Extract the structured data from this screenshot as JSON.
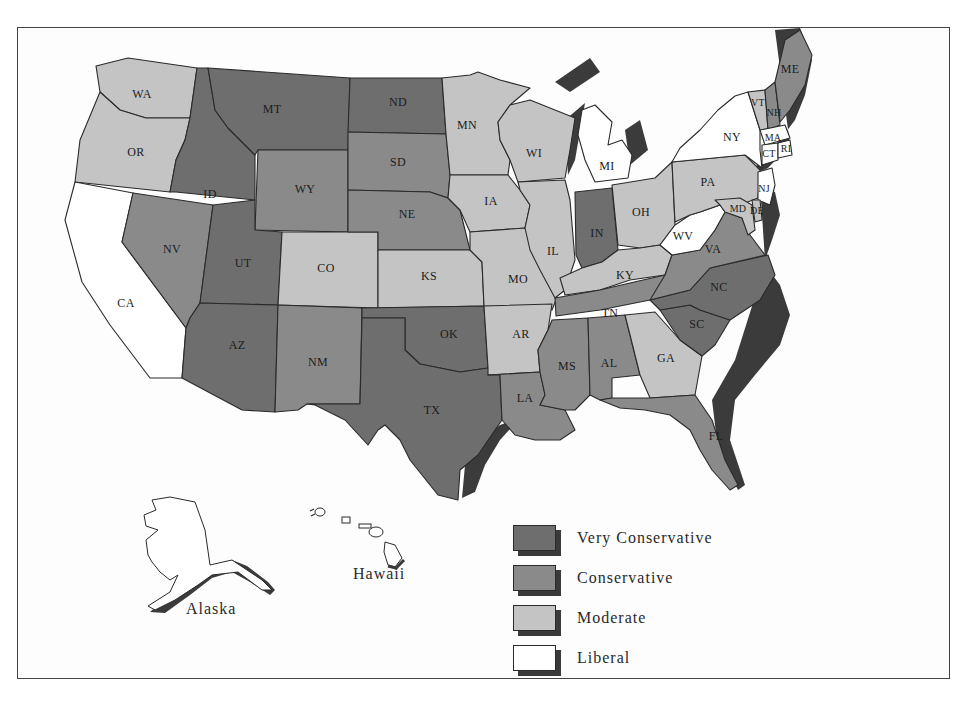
{
  "map": {
    "type": "choropleth",
    "region": "United States",
    "legend": [
      {
        "key": "very_conservative",
        "label": "Very Conservative",
        "color": "#6e6e6e"
      },
      {
        "key": "conservative",
        "label": "Conservative",
        "color": "#8a8a8a"
      },
      {
        "key": "moderate",
        "label": "Moderate",
        "color": "#c4c4c4"
      },
      {
        "key": "liberal",
        "label": "Liberal",
        "color": "#ffffff"
      }
    ],
    "insets": {
      "alaska": "Alaska",
      "hawaii": "Hawaii"
    },
    "states": {
      "WA": "moderate",
      "OR": "moderate",
      "CA": "liberal",
      "ID": "very_conservative",
      "NV": "conservative",
      "MT": "very_conservative",
      "WY": "conservative",
      "UT": "very_conservative",
      "AZ": "very_conservative",
      "CO": "moderate",
      "NM": "conservative",
      "ND": "very_conservative",
      "SD": "conservative",
      "NE": "conservative",
      "KS": "moderate",
      "OK": "very_conservative",
      "TX": "very_conservative",
      "MN": "moderate",
      "IA": "moderate",
      "MO": "moderate",
      "AR": "moderate",
      "LA": "conservative",
      "WI": "moderate",
      "IL": "moderate",
      "MI": "liberal",
      "IN": "very_conservative",
      "OH": "moderate",
      "KY": "moderate",
      "TN": "conservative",
      "MS": "conservative",
      "AL": "conservative",
      "GA": "moderate",
      "FL": "conservative",
      "SC": "very_conservative",
      "NC": "very_conservative",
      "VA": "conservative",
      "WV": "liberal",
      "PA": "moderate",
      "NY": "liberal",
      "VT": "moderate",
      "NH": "conservative",
      "ME": "conservative",
      "MA": "liberal",
      "RI": "liberal",
      "CT": "liberal",
      "NJ": "liberal",
      "DE": "moderate",
      "MD": "moderate"
    },
    "labels": {
      "WA": "WA",
      "OR": "OR",
      "CA": "CA",
      "ID": "ID",
      "NV": "NV",
      "MT": "MT",
      "WY": "WY",
      "UT": "UT",
      "AZ": "AZ",
      "CO": "CO",
      "NM": "NM",
      "ND": "ND",
      "SD": "SD",
      "NE": "NE",
      "KS": "KS",
      "OK": "OK",
      "TX": "TX",
      "MN": "MN",
      "IA": "IA",
      "MO": "MO",
      "AR": "AR",
      "LA": "LA",
      "WI": "WI",
      "IL": "IL",
      "MI": "MI",
      "IN": "IN",
      "OH": "OH",
      "KY": "KY",
      "TN": "TN",
      "MS": "MS",
      "AL": "AL",
      "GA": "GA",
      "FL": "FL",
      "SC": "SC",
      "NC": "NC",
      "VA": "VA",
      "WV": "WV",
      "PA": "PA",
      "NY": "NY",
      "VT": "VT",
      "NH": "NH",
      "ME": "ME",
      "MA": "MA",
      "RI": "RI",
      "CT": "CT",
      "NJ": "NJ",
      "DE": "DE",
      "MD": "MD"
    }
  }
}
